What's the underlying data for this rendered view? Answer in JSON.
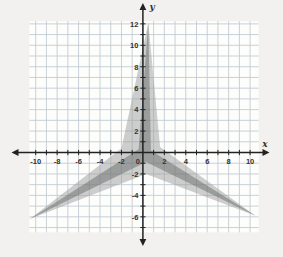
{
  "chart_data": {
    "type": "polygon",
    "title": "",
    "xlabel": "x",
    "ylabel": "y",
    "grid": true,
    "xlim": [
      -10.6,
      10.8
    ],
    "ylim": [
      -7.45,
      12.25
    ],
    "tick_step": 1,
    "label_step": 2,
    "x_label_values": [
      -10,
      -8,
      -6,
      -4,
      -2,
      0,
      2,
      4,
      6,
      8,
      10
    ],
    "y_label_values": [
      12,
      10,
      8,
      6,
      4,
      2,
      -2,
      -4,
      -6
    ],
    "origin_label": "0",
    "series": [
      {
        "name": "light-star",
        "fill": "#9b9d9c",
        "opacity": 0.5,
        "vertices": [
          [
            0.5,
            12.1
          ],
          [
            1.6,
            0.5
          ],
          [
            10.5,
            -5.9
          ],
          [
            0.3,
            -2.0
          ],
          [
            -10.55,
            -6.2
          ],
          [
            -2.0,
            0.4
          ]
        ]
      },
      {
        "name": "dark-star",
        "fill": "#6e706f",
        "opacity": 0.52,
        "vertices": [
          [
            0.5,
            12.1
          ],
          [
            0.75,
            0.2
          ],
          [
            10.5,
            -5.9
          ],
          [
            0.3,
            -0.9
          ],
          [
            -10.55,
            -6.2
          ],
          [
            -0.4,
            0.3
          ]
        ]
      }
    ],
    "colors": {
      "page_bg": "#f2f1ef",
      "plot_bg": "#fdfdfc",
      "grid_line": "#c3ccd3",
      "axis": "#222222",
      "tick_label": "#333333"
    }
  }
}
